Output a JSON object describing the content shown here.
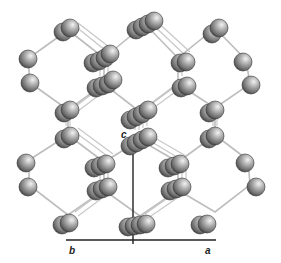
{
  "figure": {
    "type": "crystal-structure",
    "axes": {
      "a_label": "a",
      "b_label": "b",
      "c_label": "c"
    },
    "colors": {
      "atom_light": "#e6e6e6",
      "atom_mid": "#9a9a9a",
      "atom_dark": "#3a3a3a",
      "bond": "#bdbdbd",
      "axis": "#222222"
    }
  }
}
